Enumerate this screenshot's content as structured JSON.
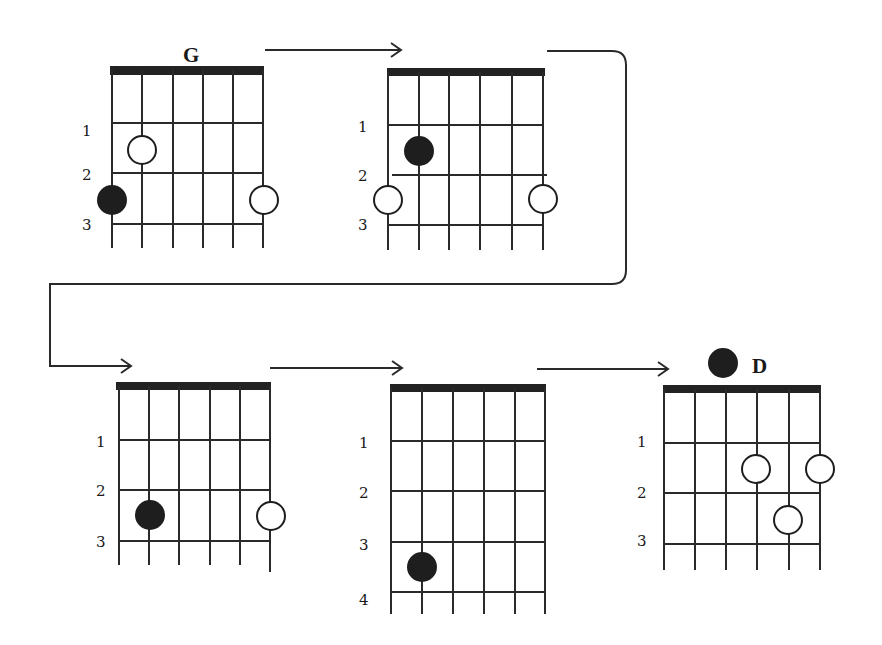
{
  "colors": {
    "ink": "#1e1e1e",
    "background": "#ffffff"
  },
  "diagrams": [
    {
      "id": "diagram-1",
      "chord_name": "G",
      "fret_labels": [
        "1",
        "2",
        "3"
      ],
      "markers": [
        {
          "string": 1,
          "fret": 2,
          "type": "open"
        },
        {
          "string": 0,
          "fret": 3,
          "type": "filled"
        },
        {
          "string": 5,
          "fret": 3,
          "type": "open"
        }
      ]
    },
    {
      "id": "diagram-2",
      "chord_name": "",
      "fret_labels": [
        "1",
        "2",
        "3"
      ],
      "markers": [
        {
          "string": 1,
          "fret": 2,
          "type": "filled"
        },
        {
          "string": 0,
          "fret": 3,
          "type": "open"
        },
        {
          "string": 5,
          "fret": 3,
          "type": "open"
        }
      ]
    },
    {
      "id": "diagram-3",
      "chord_name": "",
      "fret_labels": [
        "1",
        "2",
        "3"
      ],
      "markers": [
        {
          "string": 1,
          "fret": 3,
          "type": "filled"
        },
        {
          "string": 5,
          "fret": 3,
          "type": "open"
        }
      ]
    },
    {
      "id": "diagram-4",
      "chord_name": "",
      "fret_labels": [
        "1",
        "2",
        "3",
        "4"
      ],
      "markers": [
        {
          "string": 1,
          "fret": 4,
          "type": "filled"
        }
      ]
    },
    {
      "id": "diagram-5",
      "chord_name": "D",
      "fret_labels": [
        "1",
        "2",
        "3"
      ],
      "markers": [
        {
          "string": 3,
          "fret": 2,
          "type": "open"
        },
        {
          "string": 5,
          "fret": 2,
          "type": "open"
        },
        {
          "string": 4,
          "fret": 3,
          "type": "open"
        },
        {
          "string": 2,
          "fret": 0,
          "type": "filled",
          "note": "above nut beside chord name"
        }
      ]
    }
  ],
  "flow_arrows": [
    {
      "from": "diagram-1",
      "to": "diagram-2"
    },
    {
      "from": "diagram-2",
      "to": "diagram-3",
      "routed": "around right side and back to left"
    },
    {
      "from": "diagram-3",
      "to": "diagram-4"
    },
    {
      "from": "diagram-4",
      "to": "diagram-5"
    }
  ]
}
